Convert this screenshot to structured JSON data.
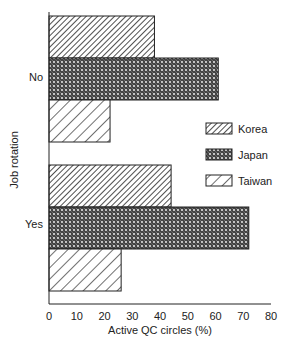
{
  "chart_data": {
    "type": "bar",
    "orientation": "horizontal",
    "title": "",
    "xlabel": "Active QC circles (%)",
    "ylabel": "Job rotation",
    "xlim": [
      0,
      80
    ],
    "xticks": [
      0,
      10,
      20,
      30,
      40,
      50,
      60,
      70,
      80
    ],
    "categories": [
      "No",
      "Yes"
    ],
    "series": [
      {
        "name": "Korea",
        "pattern": "dense-diagonal",
        "values": [
          38,
          44
        ]
      },
      {
        "name": "Japan",
        "pattern": "crosshatch-dots",
        "values": [
          61,
          72
        ]
      },
      {
        "name": "Taiwan",
        "pattern": "sparse-diagonal",
        "values": [
          22,
          26
        ]
      }
    ],
    "grid": false,
    "legend_position": "right-middle inside"
  },
  "legend": {
    "items": [
      {
        "label": "Korea"
      },
      {
        "label": "Japan"
      },
      {
        "label": "Taiwan"
      }
    ]
  },
  "axes": {
    "x_label": "Active QC circles (%)",
    "y_label": "Job rotation",
    "y_categories": [
      "No",
      "Yes"
    ],
    "x_ticks": [
      "0",
      "10",
      "20",
      "30",
      "40",
      "50",
      "60",
      "70",
      "80"
    ]
  }
}
